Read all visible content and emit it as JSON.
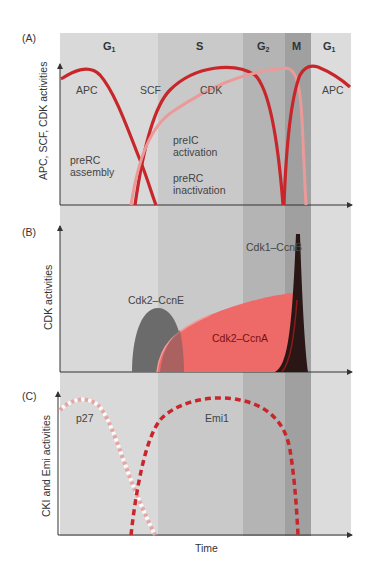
{
  "figure": {
    "phases": [
      {
        "label": "G1",
        "sub": "1",
        "x0": 60,
        "x1": 158,
        "color": "#d9d9d9"
      },
      {
        "label": "S",
        "sub": "",
        "x0": 158,
        "x1": 243,
        "color": "#c9c9c9"
      },
      {
        "label": "G2",
        "sub": "2",
        "x0": 243,
        "x1": 285,
        "color": "#b4b4b4"
      },
      {
        "label": "M",
        "sub": "",
        "x0": 285,
        "x1": 311,
        "color": "#a0a0a0"
      },
      {
        "label": "G1",
        "sub": "1",
        "x0": 311,
        "x1": 351,
        "color": "#dcdcdc"
      }
    ],
    "panel_a": {
      "tag": "(A)",
      "ylabel": "APC, SCF, CDK activities",
      "labels": {
        "apc_left": "APC",
        "scf": "SCF",
        "cdk": "CDK",
        "apc_right": "APC",
        "prerc_assembly_1": "preRC",
        "prerc_assembly_2": "assembly",
        "preic_1": "preIC",
        "preic_2": "activation",
        "prerc_inact_1": "preRC",
        "prerc_inact_2": "inactivation"
      }
    },
    "panel_b": {
      "tag": "(B)",
      "ylabel": "CDK activities",
      "labels": {
        "cdk1_ccnb": "Cdk1–CcnB",
        "cdk2_ccne": "Cdk2–CcnE",
        "cdk2_ccna": "Cdk2–CcnA"
      }
    },
    "panel_c": {
      "tag": "(C)",
      "ylabel": "CKI and Emi activities",
      "xlabel": "Time",
      "labels": {
        "p27": "p27",
        "emi1": "Emi1"
      }
    },
    "colors": {
      "red_dark": "#c8262b",
      "pink": "#eb9a9a",
      "salmon": "#ee6a68",
      "grey_shape": "#6b6b6b",
      "black_peak": "#2a1614"
    }
  }
}
